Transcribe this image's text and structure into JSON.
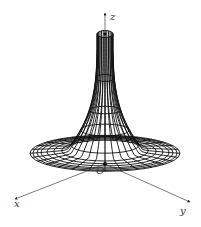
{
  "figure": {
    "type": "surface-of-revolution-wireframe",
    "axes": {
      "x_label": "x",
      "y_label": "y",
      "z_label": "z",
      "origin_label": "O"
    },
    "geometry": {
      "center_x": 105,
      "origin_y": 164,
      "top_y": 34,
      "top_radius": 8,
      "base_radius": 75,
      "base_flare_y": 183,
      "ellipse_ratio": 0.24,
      "meridians": 28,
      "parallels": [
        34,
        78,
        110,
        130,
        145,
        156,
        164,
        170,
        175,
        178,
        181,
        183
      ]
    },
    "colors": {
      "line": "#111111",
      "background": "#ffffff",
      "label": "#333333"
    }
  }
}
